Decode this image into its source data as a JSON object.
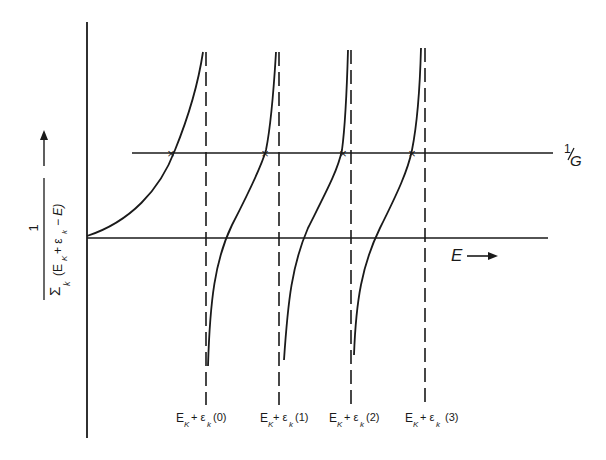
{
  "diagram": {
    "y_axis_label": {
      "numerator": "1",
      "denominator_sum": "Σ",
      "denominator_index": "k",
      "denominator_expr": "(E",
      "denominator_sub_K": "K",
      "denominator_plus": "+ ε",
      "denominator_sub_k": "k",
      "denominator_tail": "− E)"
    },
    "x_axis_label": "E",
    "horizontal_line_label": {
      "num": "1",
      "den": "G"
    },
    "asymptote_labels": [
      {
        "base": "E",
        "sub1": "K",
        "mid": "+ ε",
        "sub2": "k",
        "arg": "(0)"
      },
      {
        "base": "E",
        "sub1": "K",
        "mid": "+ ε",
        "sub2": "k",
        "arg": "(1)"
      },
      {
        "base": "E",
        "sub1": "K",
        "mid": "+ ε",
        "sub2": "k",
        "arg": "(2)"
      },
      {
        "base": "E",
        "sub1": "K",
        "mid": "+ ε",
        "sub2": "k",
        "arg": "(3)"
      }
    ],
    "intersection_marker": "×",
    "colors": {
      "ink": "#1a1a1a",
      "background": "#ffffff"
    }
  }
}
